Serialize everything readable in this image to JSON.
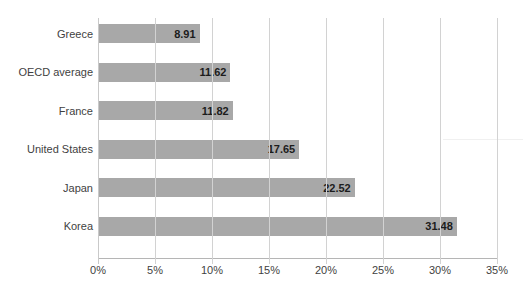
{
  "chart_data": {
    "type": "bar",
    "orientation": "horizontal",
    "title": "",
    "xlabel": "",
    "ylabel": "",
    "categories": [
      "Greece",
      "OECD average",
      "France",
      "United States",
      "Japan",
      "Korea"
    ],
    "values": [
      8.91,
      11.62,
      11.82,
      17.65,
      22.52,
      31.48
    ],
    "value_labels": [
      "8.91",
      "11.62",
      "11.82",
      "17.65",
      "22.52",
      "31.48"
    ],
    "xlim": [
      0,
      35
    ],
    "xticks": [
      0,
      5,
      10,
      15,
      20,
      25,
      30,
      35
    ],
    "xtick_labels": [
      "0%",
      "5%",
      "10%",
      "15%",
      "20%",
      "25%",
      "30%",
      "35%"
    ],
    "grid": true,
    "grid_axis": "x",
    "legend": false,
    "series": [
      {
        "name": "",
        "values": [
          8.91,
          11.62,
          11.82,
          17.65,
          22.52,
          31.48
        ],
        "color": "#a8a8a8"
      }
    ]
  },
  "colors": {
    "bar": "#a8a8a8",
    "gridline": "#d2d2d2",
    "axis": "#b5b5b5",
    "text": "#3f3f3f",
    "value_text": "#1c1c1c",
    "background": "#ffffff"
  }
}
